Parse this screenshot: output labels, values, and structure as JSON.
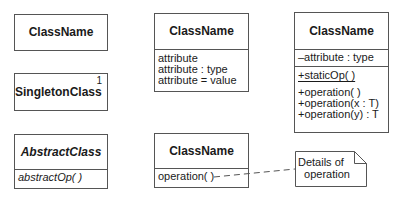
{
  "diagram": {
    "type": "UML class notation",
    "classes": [
      {
        "id": "simple",
        "name": "ClassName"
      },
      {
        "id": "singleton",
        "name": "SingletonClass",
        "multiplicity": "1"
      },
      {
        "id": "abstract",
        "name": "AbstractClass",
        "operations": [
          "abstractOp( )"
        ]
      },
      {
        "id": "attributes",
        "name": "ClassName",
        "attributes": [
          "attribute",
          "attribute : type",
          "attribute = value"
        ]
      },
      {
        "id": "operation",
        "name": "ClassName",
        "operations": [
          "operation( )"
        ]
      },
      {
        "id": "full",
        "name": "ClassName",
        "attributes": [
          "–attribute : type"
        ],
        "static_operations": [
          "+staticOp( )"
        ],
        "operations": [
          "+operation( )",
          "+operation(x : T)",
          "+operation(y) : T"
        ]
      }
    ],
    "note": {
      "lines": [
        "Details of",
        "operation"
      ]
    },
    "colors": {
      "stroke": "#555555",
      "text": "#1a1a1a",
      "background": "#ffffff"
    }
  }
}
